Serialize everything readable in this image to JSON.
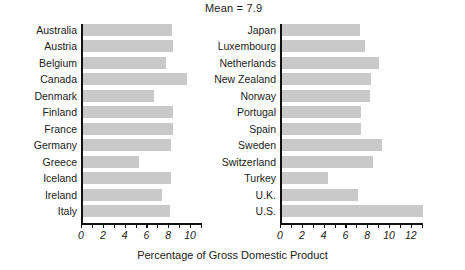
{
  "annotation": {
    "mean_label": "Mean = 7.9"
  },
  "axis": {
    "xlabel": "Percentage of Gross Domestic Product",
    "left_ticks": [
      "0",
      "2",
      "4",
      "6",
      "8",
      "10"
    ],
    "right_ticks": [
      "0",
      "2",
      "4",
      "6",
      "8",
      "10",
      "12"
    ]
  },
  "chart_data": {
    "type": "bar",
    "orientation": "horizontal",
    "title": "Mean = 7.9",
    "xlabel": "Percentage of Gross Domestic Product",
    "ylabel": "",
    "grid": false,
    "legend": false,
    "annotations": [
      "Mean = 7.9"
    ],
    "panels": [
      {
        "name": "left-panel",
        "xlim": [
          0,
          11
        ],
        "xticks": [
          0,
          2,
          4,
          6,
          8,
          10
        ],
        "categories": [
          "Australia",
          "Austria",
          "Belgium",
          "Canada",
          "Denmark",
          "Finland",
          "France",
          "Germany",
          "Greece",
          "Iceland",
          "Ireland",
          "Italy"
        ],
        "values": [
          8.2,
          8.3,
          7.7,
          9.6,
          6.6,
          8.3,
          8.3,
          8.1,
          5.2,
          8.1,
          7.3,
          8.0
        ]
      },
      {
        "name": "right-panel",
        "xlim": [
          0,
          13.6
        ],
        "xticks": [
          0,
          2,
          4,
          6,
          8,
          10,
          12
        ],
        "categories": [
          "Japan",
          "Luxembourg",
          "Netherlands",
          "New Zealand",
          "Norway",
          "Portugal",
          "Spain",
          "Sweden",
          "Switzerland",
          "Turkey",
          "U.K.",
          "U.S."
        ],
        "values": [
          7.2,
          7.7,
          8.9,
          8.2,
          8.1,
          7.3,
          7.3,
          9.2,
          8.4,
          4.3,
          7.0,
          13.0
        ]
      }
    ],
    "units": "percent of GDP",
    "mean": 7.9
  },
  "style": {
    "bar_color": "#c9c9c9",
    "axis_color": "#111111",
    "text_color": "#1b1b1b",
    "background": "#ffffff"
  }
}
